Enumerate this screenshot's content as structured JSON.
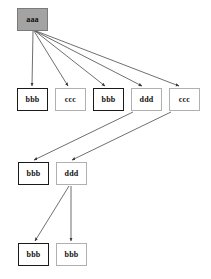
{
  "diagram": {
    "background": "#ffffff",
    "width": 211,
    "height": 279,
    "colors": {
      "node_fill_default": "#ffffff",
      "node_fill_root": "#a3a3a3",
      "border_bold": "#1a1a1a",
      "border_light": "#b0b0b0",
      "edge": "#4a4a4a",
      "text": "#101010"
    },
    "nodes": [
      {
        "id": "n0",
        "label": "aaa",
        "x": 17,
        "y": 8,
        "w": 31,
        "h": 23,
        "style": "style-filled",
        "row": 1
      },
      {
        "id": "n1",
        "label": "bbb",
        "x": 17,
        "y": 88,
        "w": 31,
        "h": 23,
        "style": "style-bold",
        "row": 2
      },
      {
        "id": "n2",
        "label": "ccc",
        "x": 55,
        "y": 88,
        "w": 31,
        "h": 23,
        "style": "style-light",
        "row": 2
      },
      {
        "id": "n3",
        "label": "bbb",
        "x": 93,
        "y": 88,
        "w": 31,
        "h": 23,
        "style": "style-bold",
        "row": 2
      },
      {
        "id": "n4",
        "label": "ddd",
        "x": 131,
        "y": 88,
        "w": 31,
        "h": 23,
        "style": "style-light",
        "row": 2
      },
      {
        "id": "n5",
        "label": "ccc",
        "x": 169,
        "y": 88,
        "w": 31,
        "h": 23,
        "style": "style-light",
        "row": 2
      },
      {
        "id": "n6",
        "label": "bbb",
        "x": 18,
        "y": 162,
        "w": 31,
        "h": 23,
        "style": "style-bold",
        "row": 3
      },
      {
        "id": "n7",
        "label": "ddd",
        "x": 56,
        "y": 162,
        "w": 31,
        "h": 23,
        "style": "style-light",
        "row": 3
      },
      {
        "id": "n8",
        "label": "bbb",
        "x": 18,
        "y": 243,
        "w": 31,
        "h": 23,
        "style": "style-bold",
        "row": 4
      },
      {
        "id": "n9",
        "label": "bbb",
        "x": 56,
        "y": 243,
        "w": 31,
        "h": 23,
        "style": "style-light",
        "row": 4
      }
    ],
    "edges": [
      {
        "id": "e0",
        "from": "n0",
        "to": "n1",
        "x1": 33,
        "y1": 31,
        "x2": 32,
        "y2": 86
      },
      {
        "id": "e1",
        "from": "n0",
        "to": "n2",
        "x1": 34,
        "y1": 31,
        "x2": 68,
        "y2": 86
      },
      {
        "id": "e2",
        "from": "n0",
        "to": "n3",
        "x1": 35,
        "y1": 31,
        "x2": 105,
        "y2": 86
      },
      {
        "id": "e3",
        "from": "n0",
        "to": "n4",
        "x1": 35,
        "y1": 31,
        "x2": 142,
        "y2": 86
      },
      {
        "id": "e4",
        "from": "n0",
        "to": "n5",
        "x1": 36,
        "y1": 31,
        "x2": 179,
        "y2": 86
      },
      {
        "id": "e5",
        "from": "n4",
        "to": "n6",
        "x1": 133,
        "y1": 112,
        "x2": 34,
        "y2": 160
      },
      {
        "id": "e6",
        "from": "n5",
        "to": "n7",
        "x1": 171,
        "y1": 112,
        "x2": 72,
        "y2": 160
      },
      {
        "id": "e7",
        "from": "n7",
        "to": "n8",
        "x1": 69,
        "y1": 186,
        "x2": 35,
        "y2": 241
      },
      {
        "id": "e8",
        "from": "n7",
        "to": "n9",
        "x1": 71,
        "y1": 186,
        "x2": 71,
        "y2": 241
      }
    ]
  }
}
